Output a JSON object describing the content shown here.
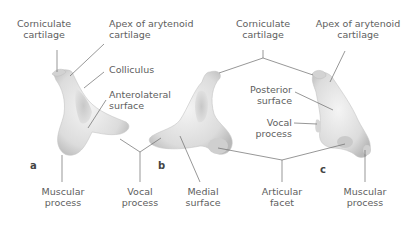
{
  "panels": [
    {
      "id": "a",
      "letter": "a"
    },
    {
      "id": "b",
      "letter": "b"
    },
    {
      "id": "c",
      "letter": "c"
    }
  ],
  "labels": {
    "a_corniculate": [
      "Corniculate",
      "cartilage"
    ],
    "a_apex": [
      "Apex of arytenoid",
      "cartilage"
    ],
    "a_colliculus": [
      "Colliculus"
    ],
    "a_anterolateral": [
      "Anterolateral",
      "surface"
    ],
    "a_muscular": [
      "Muscular",
      "process"
    ],
    "ab_vocal": [
      "Vocal",
      "process"
    ],
    "b_medial": [
      "Medial",
      "surface"
    ],
    "bc_corniculate": [
      "Corniculate",
      "cartilage"
    ],
    "c_apex": [
      "Apex of arytenoid",
      "cartilage"
    ],
    "c_posterior": [
      "Posterior",
      "surface"
    ],
    "c_vocal": [
      "Vocal",
      "process"
    ],
    "bc_articular": [
      "Articular",
      "facet"
    ],
    "c_muscular": [
      "Muscular",
      "process"
    ]
  },
  "colors": {
    "leader": "#6a6a6a",
    "cartilage": "#e6e6e6",
    "shade": "#bdbdbd"
  }
}
